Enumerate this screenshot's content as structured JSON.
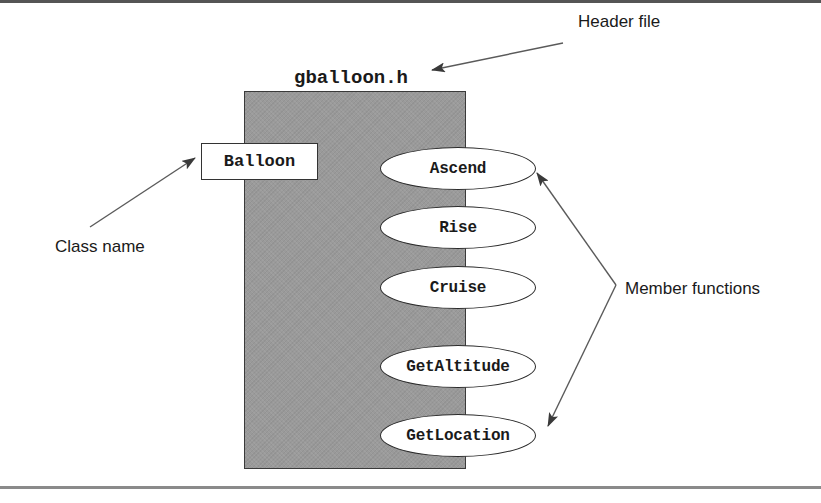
{
  "diagram": {
    "header_file": "gballoon.h",
    "class_name": "Balloon",
    "member_functions": [
      {
        "label": "Ascend"
      },
      {
        "label": "Rise"
      },
      {
        "label": "Cruise"
      },
      {
        "label": "GetAltitude"
      },
      {
        "label": "GetLocation"
      }
    ]
  },
  "annotations": {
    "header_file": "Header file",
    "class_name": "Class name",
    "member_functions": "Member functions"
  },
  "colors": {
    "header_fill": "#9a9a9a",
    "outline": "#2a2a2a",
    "arrow": "#555555",
    "text": "#1a1a1a"
  }
}
